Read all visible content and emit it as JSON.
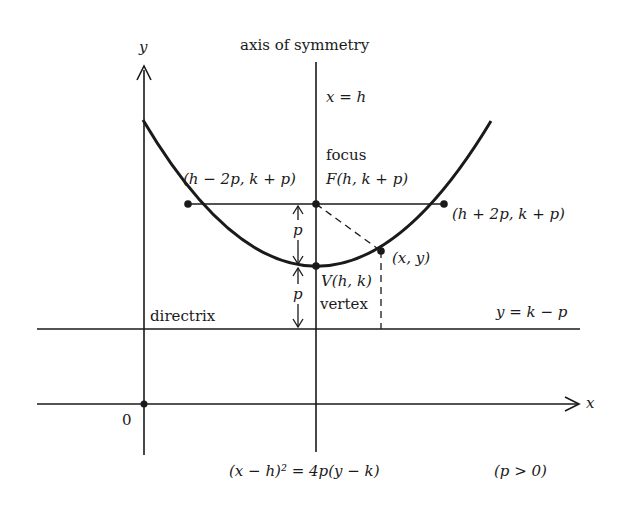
{
  "figure": {
    "y_axis_label": "y",
    "x_axis_label": "x",
    "origin_label": "0",
    "axis_of_symmetry_label": "axis of symmetry",
    "axis_equation": "x = h",
    "focus_label": "focus",
    "focus_point": "F(h, k + p)",
    "left_latus_point": "(h − 2p, k + p)",
    "right_latus_point": "(h + 2p, k + p)",
    "general_point": "(x, y)",
    "vertex_point": "V(h, k)",
    "vertex_label": "vertex",
    "directrix_label": "directrix",
    "directrix_equation": "y = k − p",
    "p_label_upper": "p",
    "p_label_lower": "p",
    "equation": "(x − h)² = 4p(y − k)",
    "condition": "(p > 0)"
  },
  "colors": {
    "ink": "#1a1a1a",
    "background": "#ffffff"
  }
}
